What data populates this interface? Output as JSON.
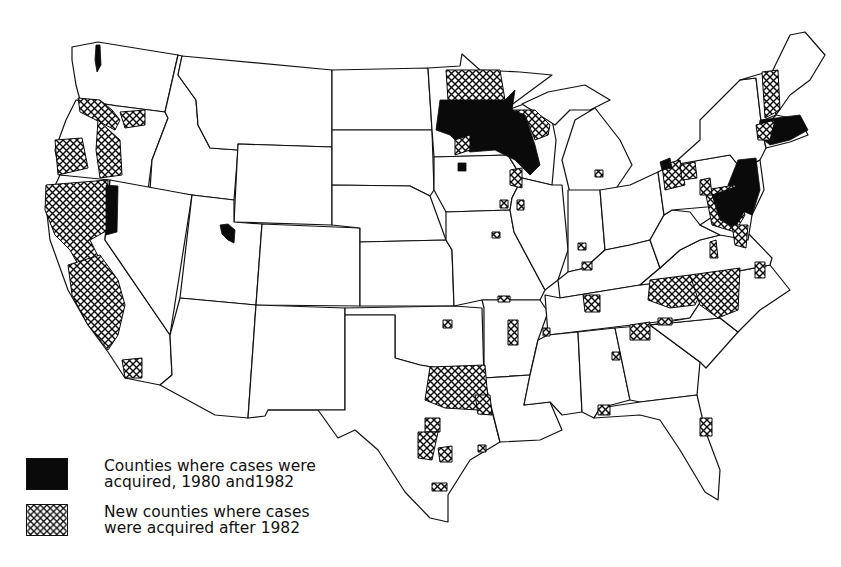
{
  "map": {
    "title": "",
    "region": "Contiguous United States",
    "level": "County",
    "legend": [
      {
        "symbol": "solid-black",
        "line1": "Counties where cases were",
        "line2": "acquired, 1980 and1982"
      },
      {
        "symbol": "cross-hatched",
        "line1": "New counties where cases",
        "line2": "were acquired after 1982"
      }
    ],
    "colors": {
      "solid": "#0a0a0a",
      "hatch_line": "#0a0a0a",
      "background": "#ffffff",
      "state_border": "#111111"
    },
    "clusters": [
      {
        "area": "Minnesota / Wisconsin",
        "type": "solid+hatched",
        "density": "high"
      },
      {
        "area": "Northeast (NJ, NY, CT, MA, RI, PA, MD)",
        "type": "solid+hatched",
        "density": "high"
      },
      {
        "area": "California / Oregon coast",
        "type": "hatched",
        "density": "high"
      },
      {
        "area": "Northern California / Nevada border",
        "type": "solid",
        "density": "medium"
      },
      {
        "area": "Washington (Puget Sound)",
        "type": "solid",
        "density": "low"
      },
      {
        "area": "Utah",
        "type": "solid",
        "density": "low"
      },
      {
        "area": "North Texas / Oklahoma",
        "type": "hatched",
        "density": "medium"
      },
      {
        "area": "North Carolina / Virginia / Tennessee",
        "type": "hatched",
        "density": "medium"
      },
      {
        "area": "Georgia / Alabama / Florida",
        "type": "hatched",
        "density": "low"
      },
      {
        "area": "Iowa / Illinois / Indiana / Michigan",
        "type": "hatched",
        "density": "low"
      }
    ]
  }
}
